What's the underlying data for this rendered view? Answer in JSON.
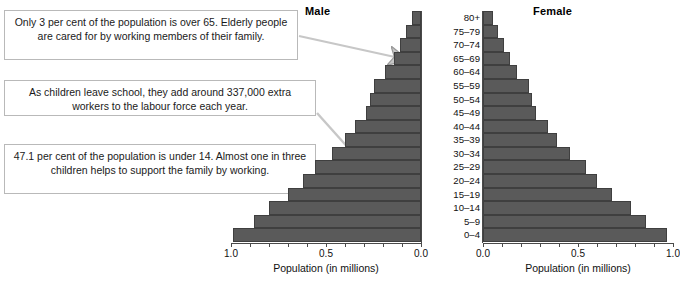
{
  "figure": {
    "male_title": "Male",
    "female_title": "Female"
  },
  "callouts": [
    {
      "id": "callout-over-65",
      "text": "Only 3 per cent of the population is over 65. Elderly people are cared for by working members of their family.",
      "points_to": "65–69"
    },
    {
      "id": "callout-school-leavers",
      "text": "As children leave school, they add around 337,000 extra workers to the labour force each year.",
      "points_to": "15–19"
    },
    {
      "id": "callout-under-14",
      "text": "47.1 per cent of the population is under 14. Almost one in three children helps to support the family by working.",
      "points_to": "10–14"
    }
  ],
  "axes": {
    "male": {
      "caption": "Population (in millions)",
      "ticks": [
        "1.0",
        "0.5",
        "0.0"
      ],
      "min": 0.0,
      "max": 1.0,
      "direction": "right-to-left"
    },
    "female": {
      "caption": "Population (in millions)",
      "ticks": [
        "0.0",
        "0.5",
        "1.0"
      ],
      "min": 0.0,
      "max": 1.0,
      "direction": "left-to-right"
    }
  },
  "chart_data": {
    "type": "bar",
    "subtype": "population-pyramid",
    "title": "",
    "xlabel": "Population (in millions)",
    "ylabel": "Age group",
    "xlim": [
      0.0,
      1.0
    ],
    "grid": false,
    "legend": [
      "Male",
      "Female"
    ],
    "legend_position": "top",
    "bar_color": "#5a5a5a",
    "categories": [
      "80+",
      "75–79",
      "70–74",
      "65–69",
      "60–64",
      "55–59",
      "50–54",
      "45–49",
      "40–44",
      "35–39",
      "30–34",
      "25–29",
      "20–24",
      "15–19",
      "10–14",
      "5–9",
      "0–4"
    ],
    "series": [
      {
        "name": "Male",
        "values": [
          0.05,
          0.08,
          0.11,
          0.14,
          0.19,
          0.25,
          0.27,
          0.29,
          0.35,
          0.4,
          0.47,
          0.56,
          0.62,
          0.7,
          0.8,
          0.88,
          0.99
        ]
      },
      {
        "name": "Female",
        "values": [
          0.05,
          0.08,
          0.11,
          0.14,
          0.18,
          0.24,
          0.26,
          0.28,
          0.34,
          0.39,
          0.46,
          0.54,
          0.6,
          0.68,
          0.78,
          0.86,
          0.97
        ]
      }
    ],
    "annotations": [
      "Only 3 per cent of the population is over 65. Elderly people are cared for by working members of their family.",
      "As children leave school, they add around 337,000 extra workers to the labour force each year.",
      "47.1 per cent of the population is under 14. Almost one in three children helps to support the family by working."
    ]
  }
}
